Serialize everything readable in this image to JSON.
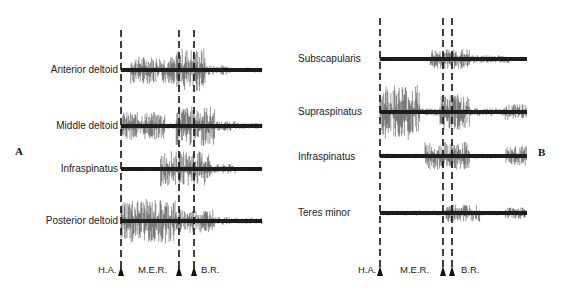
{
  "figure": {
    "panels": [
      {
        "id": "A",
        "letter": "A",
        "traces": [
          {
            "label": "Anterior deltoid",
            "baseline_y": 70
          },
          {
            "label": "Middle deltoid",
            "baseline_y": 126
          },
          {
            "label": "Infraspinatus",
            "baseline_y": 169
          },
          {
            "label": "Posterior deltoid",
            "baseline_y": 221
          }
        ],
        "markers": [
          {
            "label": "H.A.",
            "x": 121
          },
          {
            "label": "M.E.R.",
            "x": 179
          },
          {
            "label": "B.R.",
            "x": 194
          }
        ]
      },
      {
        "id": "B",
        "letter": "B",
        "traces": [
          {
            "label": "Subscapularis",
            "baseline_y": 59
          },
          {
            "label": "Supraspinatus",
            "baseline_y": 112
          },
          {
            "label": "Infraspinatus",
            "baseline_y": 156
          },
          {
            "label": "Teres minor",
            "baseline_y": 213
          }
        ],
        "markers": [
          {
            "label": "H.A.",
            "x": 380
          },
          {
            "label": "M.E.R.",
            "x": 443
          },
          {
            "label": "B.R.",
            "x": 452
          }
        ]
      }
    ],
    "phase_labels": {
      "a": {
        "ha": "H.A.",
        "mer": "M.E.R.",
        "br": "B.R."
      },
      "b": {
        "ha": "H.A.",
        "mer": "M.E.R.",
        "br": "B.R."
      }
    }
  }
}
